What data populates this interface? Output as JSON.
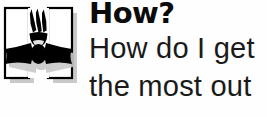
{
  "page": {
    "background_color": "#fefefe",
    "width": 267,
    "height": 117
  },
  "logo": {
    "name": "h-face-mascot-logo",
    "description": "Letter H formed by two white outlined rectangles, with black hair tufts, a smiling mouth and a black bow tie, plus a gray drop shadow",
    "letter": "H",
    "outline_color": "#000000",
    "fill_color": "#ffffff",
    "feature_color": "#000000",
    "shadow_color": "#c9c9c9",
    "parts": {
      "hair_label": "hair-tufts",
      "mouth_label": "smiling-mouth",
      "bowtie_label": "bow-tie"
    }
  },
  "text": {
    "heading": "How?",
    "lines": [
      "How do I get",
      "the most out"
    ],
    "heading_color": "#0b0b0b",
    "body_color": "#1a1a1a"
  }
}
